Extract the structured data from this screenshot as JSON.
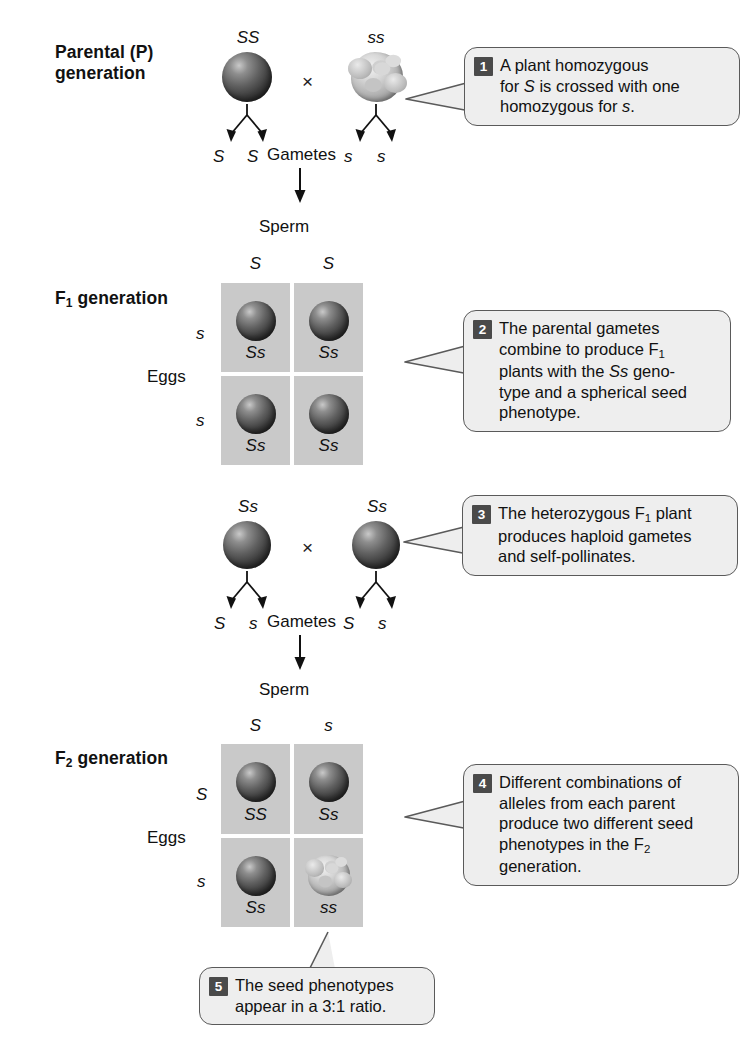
{
  "figure": {
    "seed_icons": {
      "round": "round-seed-icon",
      "wrinkled": "wrinkled-seed-icon"
    },
    "colors": {
      "grid_fill": "#c9c9c9",
      "callout_fill": "#eeeeee",
      "callout_border": "#5a5a5a",
      "badge_fill": "#4a4a4a",
      "text": "#111111"
    }
  },
  "parental": {
    "label_line1": "Parental (P)",
    "label_line2": "generation",
    "left_genotype": "SS",
    "right_genotype": "ss",
    "cross_symbol": "×",
    "left_gamete_1": "S",
    "left_gamete_2": "S",
    "right_gamete_1": "s",
    "right_gamete_2": "s",
    "gametes_label": "Gametes"
  },
  "f1": {
    "label_main": "F",
    "label_sub": "1",
    "label_rest": " generation",
    "sperm_label": "Sperm",
    "eggs_label": "Eggs",
    "sperm_alleles": [
      "S",
      "S"
    ],
    "egg_alleles": [
      "s",
      "s"
    ],
    "cells": [
      {
        "genotype": "Ss",
        "phenotype": "round"
      },
      {
        "genotype": "Ss",
        "phenotype": "round"
      },
      {
        "genotype": "Ss",
        "phenotype": "round"
      },
      {
        "genotype": "Ss",
        "phenotype": "round"
      }
    ]
  },
  "f1_cross": {
    "left_genotype": "Ss",
    "right_genotype": "Ss",
    "cross_symbol": "×",
    "left_gamete_1": "S",
    "left_gamete_2": "s",
    "right_gamete_1": "S",
    "right_gamete_2": "s",
    "gametes_label": "Gametes"
  },
  "f2": {
    "label_main": "F",
    "label_sub": "2",
    "label_rest": " generation",
    "sperm_label": "Sperm",
    "eggs_label": "Eggs",
    "sperm_alleles": [
      "S",
      "s"
    ],
    "egg_alleles": [
      "S",
      "s"
    ],
    "cells": [
      {
        "genotype": "SS",
        "phenotype": "round"
      },
      {
        "genotype": "Ss",
        "phenotype": "round"
      },
      {
        "genotype": "Ss",
        "phenotype": "round"
      },
      {
        "genotype": "ss",
        "phenotype": "wrinkled"
      }
    ],
    "phenotype_ratio": "3:1"
  },
  "callouts": [
    {
      "number": "1",
      "lines": [
        "A plant homozygous",
        "for S is crossed with one",
        "homozygous for s."
      ],
      "text": "A plant homozygous for S is crossed with one homozygous for s."
    },
    {
      "number": "2",
      "lines": [
        "The parental gametes",
        "combine to produce F1",
        "plants with the Ss geno-",
        "type and a spherical seed",
        "phenotype."
      ],
      "text": "The parental gametes combine to produce F1 plants with the Ss genotype and a spherical seed phenotype."
    },
    {
      "number": "3",
      "lines": [
        "The heterozygous F1 plant",
        "produces haploid gametes",
        "and self-pollinates."
      ],
      "text": "The heterozygous F1 plant produces haploid gametes and self-pollinates."
    },
    {
      "number": "4",
      "lines": [
        "Different combinations of",
        "alleles from each parent",
        "produce two different seed",
        "phenotypes in the F2",
        "generation."
      ],
      "text": "Different combinations of alleles from each parent produce two different seed phenotypes in the F2 generation."
    },
    {
      "number": "5",
      "lines": [
        "The seed phenotypes",
        "appear in a 3:1 ratio."
      ],
      "text": "The seed phenotypes appear in a 3:1 ratio."
    }
  ]
}
